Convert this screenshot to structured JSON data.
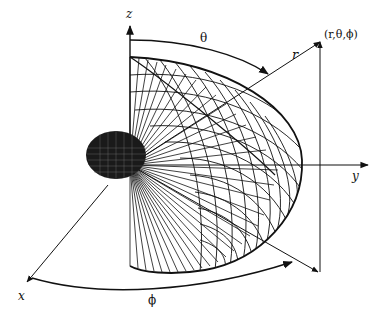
{
  "diagram": {
    "type": "spherical-coordinate-radiation-pattern",
    "labels": {
      "z_axis": "z",
      "y_axis": "y",
      "x_axis": "x",
      "theta": "θ",
      "phi": "ϕ",
      "r": "r",
      "point": "(r,θ,ϕ)"
    },
    "colors": {
      "ink": "#111111",
      "background": "#ffffff"
    }
  }
}
